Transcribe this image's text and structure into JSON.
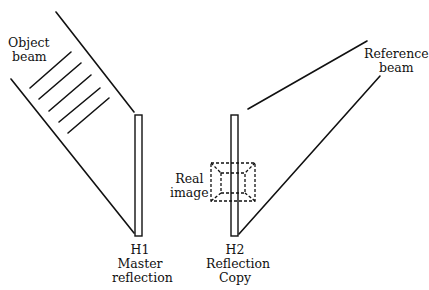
{
  "diagram": {
    "labels": {
      "object_beam": [
        "Object",
        "beam"
      ],
      "reference_beam": [
        "Reference",
        "beam"
      ],
      "real_image": [
        "Real",
        "image"
      ],
      "h1": [
        "H1",
        "Master",
        "reflection"
      ],
      "h2": [
        "H2",
        "Reflection",
        "Copy"
      ]
    },
    "colors": {
      "line": "#111111",
      "background": "#ffffff"
    }
  }
}
